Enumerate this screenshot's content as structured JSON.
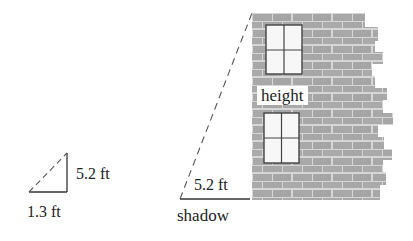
{
  "diagram": {
    "small_triangle": {
      "vertical_label": "5.2 ft",
      "base_label": "1.3 ft"
    },
    "building": {
      "height_label": "height",
      "shadow_length_label": "5.2 ft",
      "shadow_label": "shadow"
    },
    "colors": {
      "brick": "#a9a9a9",
      "mortar": "#d8d8d8",
      "line": "#333333",
      "window_fill": "#f7f7f7"
    }
  }
}
